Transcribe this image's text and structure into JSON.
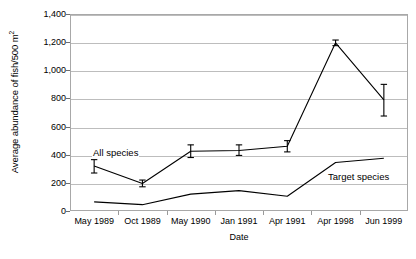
{
  "chart_data": {
    "type": "line",
    "title": "",
    "subtitle": "",
    "xlabel": "Date",
    "ylabel": "Average abundance of fish/500 m²",
    "ylabel_text": "Average abundance of fish/500 m",
    "ylabel_superscript": "2",
    "categories": [
      "May 1989",
      "Oct 1989",
      "May 1990",
      "Jan 1991",
      "Apr 1991",
      "Apr 1998",
      "Jun 1999"
    ],
    "ylim": [
      0,
      1400
    ],
    "ytick_values": [
      0,
      200,
      400,
      600,
      800,
      1000,
      1200,
      1400
    ],
    "ytick_labels": [
      "0",
      "200",
      "400",
      "600",
      "800",
      "1,000",
      "1,200",
      "1,400"
    ],
    "grid": true,
    "grid_axis": "y",
    "legend": "inline-annotations",
    "series": [
      {
        "name": "All species",
        "values": [
          320,
          195,
          425,
          430,
          460,
          1195,
          790
        ],
        "error_low": [
          270,
          172,
          380,
          395,
          420,
          1175,
          675
        ],
        "error_high": [
          365,
          220,
          470,
          470,
          500,
          1215,
          900
        ],
        "has_error_bars": true,
        "color": "#000000"
      },
      {
        "name": "Target species",
        "values": [
          65,
          45,
          120,
          145,
          105,
          345,
          375
        ],
        "has_error_bars": false,
        "color": "#000000"
      }
    ],
    "annotations": [
      {
        "text": "All species",
        "series": "All species"
      },
      {
        "text": "Target species",
        "series": "Target species"
      }
    ]
  },
  "colors": {
    "line": "#000000",
    "grid": "#bdbdbd",
    "axis": "#a8a8a8",
    "background": "#ffffff"
  }
}
